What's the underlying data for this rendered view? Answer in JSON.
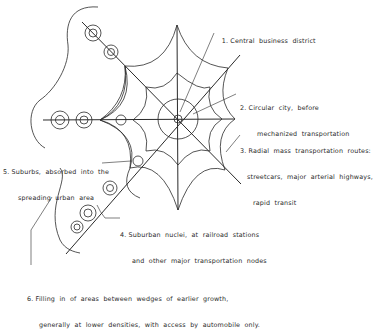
{
  "diagram": {
    "type": "urban-growth-schematic",
    "labels": [
      {
        "id": "1",
        "line1": "1. Central  business  district",
        "line2": ""
      },
      {
        "id": "2",
        "line1": "2. Circular  city,  before",
        "line2": "mechanized  transportation"
      },
      {
        "id": "3",
        "line1": "3. Radial  mass  transportation  routes:",
        "line2": "streetcars,  major  arterial  highways,",
        "line3": "rapid  transit"
      },
      {
        "id": "4",
        "line1": "4. Suburban  nuclei,  at  railroad  stations",
        "line2": "and  other  major  transportation  nodes"
      },
      {
        "id": "5",
        "line1": "5. Suburbs,  absorbed  into  the",
        "line2": "spreading  urban  area"
      },
      {
        "id": "6",
        "line1": "6. Filling  in  of  areas  between  wedges  of  earlier  growth,",
        "line2": "generally  at  lower  densities,  with  access  by  automobile  only."
      }
    ],
    "stroke_color": "#2a2a2a",
    "background": "#ffffff"
  }
}
